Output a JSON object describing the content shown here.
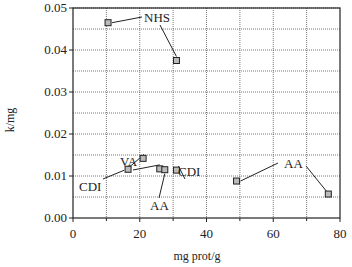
{
  "chart_data": {
    "type": "scatter",
    "title": "",
    "xlabel": "mg prot/g",
    "ylabel": "k/mg",
    "xlim": [
      0,
      80
    ],
    "ylim": [
      0,
      0.05
    ],
    "xticks": [
      "0",
      "20",
      "40",
      "60",
      "80"
    ],
    "yticks": [
      "0.00",
      "0.01",
      "0.02",
      "0.03",
      "0.04",
      "0.05"
    ],
    "grid": true,
    "legend": null,
    "points": [
      {
        "x": 10.5,
        "y": 0.0465,
        "label": "NHS"
      },
      {
        "x": 31.0,
        "y": 0.0375,
        "label": "NHS"
      },
      {
        "x": 21.0,
        "y": 0.0142,
        "label": "VA"
      },
      {
        "x": 16.5,
        "y": 0.0116,
        "label": "CDI"
      },
      {
        "x": 26.0,
        "y": 0.0117,
        "label": "AA"
      },
      {
        "x": 27.5,
        "y": 0.0115,
        "label": "AA"
      },
      {
        "x": 31.0,
        "y": 0.0114,
        "label": "CDI"
      },
      {
        "x": 49.0,
        "y": 0.0088,
        "label": "AA"
      },
      {
        "x": 76.5,
        "y": 0.0057,
        "label": "AA"
      }
    ],
    "annotations": [
      "NHS",
      "VA",
      "CDI",
      "CDI",
      "AA",
      "AA"
    ]
  }
}
